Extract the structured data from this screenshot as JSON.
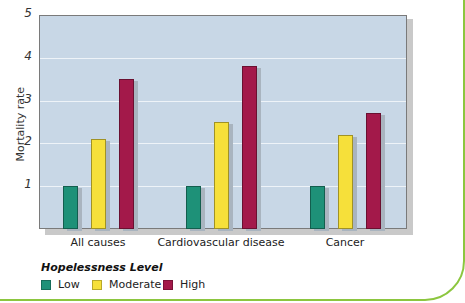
{
  "chart_data": {
    "type": "bar",
    "title": "",
    "xlabel": "",
    "ylabel": "Mortality rate",
    "ylim": [
      0,
      5
    ],
    "yticks": [
      1,
      2,
      3,
      4,
      5
    ],
    "grid": true,
    "legend_position": "bottom-left",
    "legend_title": "Hopelessness Level",
    "categories": [
      "All causes",
      "Cardiovascular disease",
      "Cancer"
    ],
    "series": [
      {
        "name": "Low",
        "color": "#1e9178",
        "values": [
          1.0,
          1.0,
          1.0
        ]
      },
      {
        "name": "Moderate",
        "color": "#f6e03a",
        "values": [
          2.1,
          2.5,
          2.2
        ]
      },
      {
        "name": "High",
        "color": "#a3194a",
        "values": [
          3.5,
          3.8,
          2.7
        ]
      }
    ]
  },
  "colors": {
    "plot_background": "#c8d7e6",
    "frame_border": "#8cc63f"
  }
}
